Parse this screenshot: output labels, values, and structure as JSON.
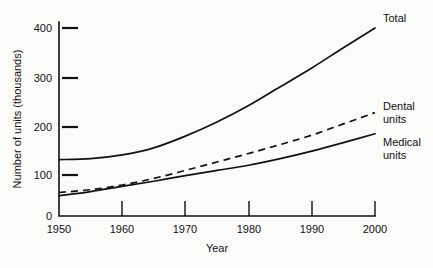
{
  "chart_data": {
    "type": "line",
    "title": "",
    "xlabel": "Year",
    "ylabel": "Number of units (thousands)",
    "xlim": [
      1950,
      2000
    ],
    "ylim": [
      0,
      400
    ],
    "x_ticks": [
      1950,
      1960,
      1970,
      1980,
      1990,
      2000
    ],
    "x_tick_labels": [
      "1950",
      "1960",
      "1970",
      "1980",
      "1990",
      "2000"
    ],
    "y_ticks": [
      0,
      100,
      200,
      300,
      400
    ],
    "y_tick_labels": [
      "0",
      "100",
      "200",
      "300",
      "400"
    ],
    "grid": false,
    "legend_position": "right-inline-labels",
    "x": [
      1950,
      1955,
      1960,
      1965,
      1970,
      1975,
      1980,
      1985,
      1990,
      1995,
      2000
    ],
    "series": [
      {
        "name": "Total",
        "style": "solid",
        "color": "#111111",
        "label_lines": [
          "Total"
        ],
        "values": [
          120,
          122,
          130,
          145,
          170,
          200,
          235,
          275,
          315,
          358,
          400
        ]
      },
      {
        "name": "Dental units",
        "style": "dashed",
        "color": "#111111",
        "label_lines": [
          "Dental",
          "units"
        ],
        "values": [
          50,
          56,
          66,
          80,
          97,
          115,
          133,
          152,
          172,
          196,
          220
        ]
      },
      {
        "name": "Medical units",
        "style": "solid",
        "color": "#111111",
        "label_lines": [
          "Medical",
          "units"
        ],
        "values": [
          43,
          52,
          63,
          74,
          86,
          97,
          108,
          122,
          138,
          156,
          175
        ]
      }
    ]
  },
  "axis": {
    "y_label_text": "Number of units (thousands)",
    "x_label_text": "Year"
  },
  "labels": {
    "total": "Total",
    "dental_line1": "Dental",
    "dental_line2": "units",
    "medical_line1": "Medical",
    "medical_line2": "units"
  },
  "ticks": {
    "y": [
      "0",
      "100",
      "200",
      "300",
      "400"
    ],
    "x": [
      "1950",
      "1960",
      "1970",
      "1980",
      "1990",
      "2000"
    ]
  },
  "colors": {
    "ink": "#111111",
    "paper": "#fbfbfa"
  }
}
